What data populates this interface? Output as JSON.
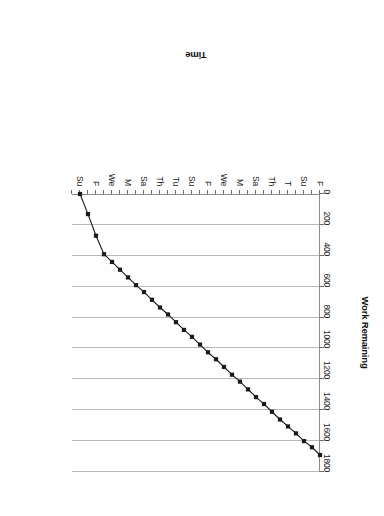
{
  "page": {
    "rotation_degrees": 180,
    "background": "#ffffff"
  },
  "chart_data": {
    "type": "line",
    "title": "",
    "subtitle": "",
    "xlabel": "Time",
    "ylabel": "Work Remaining",
    "grid": "horizontal-gridlines-on-value-axis",
    "legend": "none",
    "marker": "filled-square",
    "line_color": "#1a1a1a",
    "marker_color": "#1a1a1a",
    "gridline_color": "#b9b9b9",
    "axis_color": "#6e6e6e",
    "ylim": [
      0,
      1800
    ],
    "ytick_labels": [
      "0",
      "200",
      "400",
      "600",
      "800",
      "1000",
      "1200",
      "1400",
      "1600",
      "1800"
    ],
    "ytick_values": [
      0,
      200,
      400,
      600,
      800,
      1000,
      1200,
      1400,
      1600,
      1800
    ],
    "xtick_labels": [
      "F",
      "Su",
      "T",
      "Th",
      "Sa",
      "M",
      "We",
      "F",
      "Su",
      "Tu",
      "Th",
      "Sa",
      "M",
      "We",
      "F",
      "Su"
    ],
    "xtick_label_interval": 2,
    "x_minor_ticks_total": 31,
    "x": [
      0,
      1,
      2,
      3,
      4,
      5,
      6,
      7,
      8,
      9,
      10,
      11,
      12,
      13,
      14,
      15,
      16,
      17,
      18,
      19,
      20,
      21,
      22,
      23,
      24,
      25,
      26,
      27,
      28,
      29,
      30
    ],
    "values": [
      1690,
      1640,
      1600,
      1550,
      1505,
      1460,
      1410,
      1360,
      1315,
      1265,
      1215,
      1170,
      1120,
      1070,
      1025,
      975,
      925,
      880,
      830,
      780,
      735,
      685,
      635,
      590,
      540,
      490,
      440,
      390,
      270,
      130,
      0
    ]
  }
}
